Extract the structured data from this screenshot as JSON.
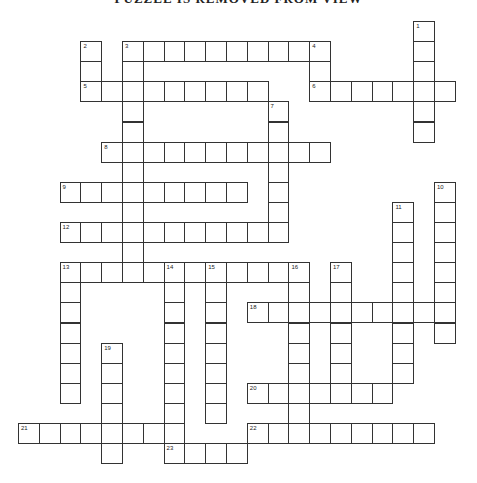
{
  "puzzle": {
    "title": "PUZZLE IS REMOVED FROM VIEW",
    "grid": {
      "x0": 18,
      "y0": 21,
      "cell_w": 20.8,
      "cell_h": 20.1
    },
    "entries": [
      {
        "number": "1",
        "direction": "down",
        "row": 0,
        "col": 19,
        "length": 6
      },
      {
        "number": "2",
        "direction": "down",
        "row": 1,
        "col": 3,
        "length": 3
      },
      {
        "number": "3",
        "direction": "across",
        "row": 1,
        "col": 5,
        "length": 10
      },
      {
        "number": "3",
        "direction": "down",
        "row": 1,
        "col": 5,
        "length": 12
      },
      {
        "number": "4",
        "direction": "down",
        "row": 1,
        "col": 14,
        "length": 3
      },
      {
        "number": "5",
        "direction": "across",
        "row": 3,
        "col": 3,
        "length": 9
      },
      {
        "number": "6",
        "direction": "across",
        "row": 3,
        "col": 14,
        "length": 7
      },
      {
        "number": "7",
        "direction": "down",
        "row": 4,
        "col": 12,
        "length": 7
      },
      {
        "number": "8",
        "direction": "across",
        "row": 6,
        "col": 4,
        "length": 11
      },
      {
        "number": "9",
        "direction": "across",
        "row": 8,
        "col": 2,
        "length": 9
      },
      {
        "number": "10",
        "direction": "down",
        "row": 8,
        "col": 20,
        "length": 8
      },
      {
        "number": "11",
        "direction": "down",
        "row": 9,
        "col": 18,
        "length": 9
      },
      {
        "number": "12",
        "direction": "across",
        "row": 10,
        "col": 2,
        "length": 11
      },
      {
        "number": "13",
        "direction": "across",
        "row": 12,
        "col": 2,
        "length": 12
      },
      {
        "number": "13",
        "direction": "down",
        "row": 12,
        "col": 2,
        "length": 7
      },
      {
        "number": "14",
        "direction": "down",
        "row": 12,
        "col": 7,
        "length": 10
      },
      {
        "number": "15",
        "direction": "down",
        "row": 12,
        "col": 9,
        "length": 8
      },
      {
        "number": "16",
        "direction": "down",
        "row": 12,
        "col": 13,
        "length": 9
      },
      {
        "number": "17",
        "direction": "down",
        "row": 12,
        "col": 15,
        "length": 7
      },
      {
        "number": "18",
        "direction": "across",
        "row": 14,
        "col": 11,
        "length": 10
      },
      {
        "number": "19",
        "direction": "down",
        "row": 16,
        "col": 4,
        "length": 6
      },
      {
        "number": "20",
        "direction": "across",
        "row": 18,
        "col": 11,
        "length": 7
      },
      {
        "number": "21",
        "direction": "across",
        "row": 20,
        "col": 0,
        "length": 8
      },
      {
        "number": "22",
        "direction": "across",
        "row": 20,
        "col": 11,
        "length": 9
      },
      {
        "number": "23",
        "direction": "across",
        "row": 21,
        "col": 7,
        "length": 4
      }
    ]
  }
}
